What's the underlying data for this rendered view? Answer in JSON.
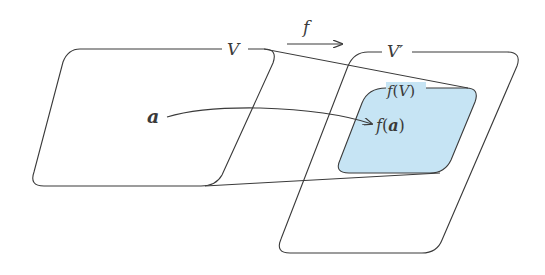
{
  "diagram": {
    "type": "function-mapping",
    "colors": {
      "stroke": "#3a3a3a",
      "image_fill": "#c6e4f4",
      "background": "#ffffff"
    },
    "map": {
      "label": "f"
    },
    "domain": {
      "label": "V"
    },
    "codomain": {
      "label": "V′"
    },
    "image_set": {
      "label_prefix": "f",
      "label_open": "(",
      "label_arg": "V",
      "label_close": ")"
    },
    "point": {
      "label": "a"
    },
    "image_point": {
      "label_prefix": "f",
      "label_open": "(",
      "label_arg": "a",
      "label_close": ")"
    }
  }
}
